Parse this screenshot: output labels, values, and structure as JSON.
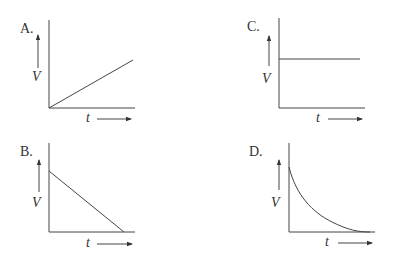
{
  "question_fragment": "",
  "panels": [
    {
      "id": "A",
      "label": "A.",
      "ylabel": "V",
      "xlabel": "t",
      "shape": "linear-increasing"
    },
    {
      "id": "B",
      "label": "B.",
      "ylabel": "V",
      "xlabel": "t",
      "shape": "linear-decreasing"
    },
    {
      "id": "C",
      "label": "C.",
      "ylabel": "V",
      "xlabel": "t",
      "shape": "constant"
    },
    {
      "id": "D",
      "label": "D.",
      "ylabel": "V",
      "xlabel": "t",
      "shape": "exponential-decay"
    }
  ],
  "colors": {
    "line": "#444444",
    "text": "#333333"
  }
}
